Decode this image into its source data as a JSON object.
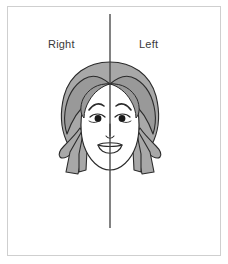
{
  "image": {
    "title": "Face symmetry diagram",
    "width": 228,
    "height": 264
  },
  "frame": {
    "border_color": "#cfcfcf",
    "background_color": "#ffffff"
  },
  "labels": {
    "right": "Right",
    "left": "Left",
    "text_color": "#3a3a3a"
  },
  "divider": {
    "name": "vertical-midline",
    "color": "#3f3f3f",
    "x": 110,
    "y_top": 14,
    "y_bottom": 228
  },
  "figure": {
    "name": "female-face-illustration",
    "hair_color": "#a8a8a8",
    "hair_shadow_color": "#999999",
    "skin_color": "#ffffff",
    "outline_color": "#2b2b2b",
    "eye_color": "#1a1a1a",
    "parts": [
      "hair-back",
      "hair-front",
      "face-oval",
      "left-eyebrow",
      "right-eyebrow",
      "left-eye",
      "right-eye",
      "nose",
      "mouth",
      "left-hair-ribbon",
      "right-hair-ribbon"
    ]
  }
}
